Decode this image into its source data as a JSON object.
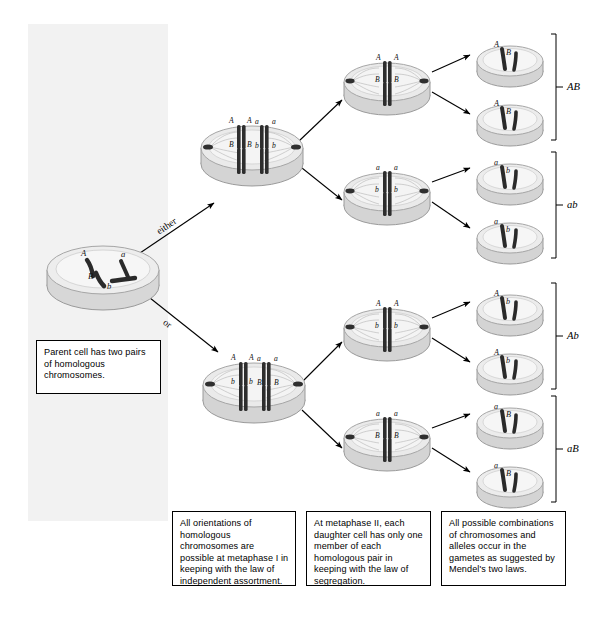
{
  "figure": {
    "background_color": "#ffffff",
    "panel_color": "#f2f2f2",
    "line_color": "#000000"
  },
  "branch_labels": {
    "upper": "either",
    "lower": "or"
  },
  "captions": [
    {
      "id": "parent-cell-caption",
      "text": "Parent cell has two pairs of homologous chromosomes."
    },
    {
      "id": "metaphase-one-caption",
      "text": "All orientations of homologous chromosomes are possible at metaphase I in keeping with the law of independent assortment."
    },
    {
      "id": "metaphase-two-caption",
      "text": "At metaphase II, each daughter cell has only one member of each homologous pair in keeping with the law of segregation."
    },
    {
      "id": "gametes-caption",
      "text": "All possible combinations of chromosomes and alleles occur in the gametes as suggested by Mendel's two laws."
    }
  ],
  "parent_cell": {
    "name": "parent-cell",
    "alleles": [
      "A",
      "a",
      "B",
      "b"
    ]
  },
  "metaphase_one_cells": [
    {
      "name": "metaphase-one-cell-upper",
      "top_row": [
        "A",
        "A",
        "a",
        "a"
      ],
      "bottom_row": [
        "B",
        "B",
        "b",
        "b"
      ]
    },
    {
      "name": "metaphase-one-cell-lower",
      "top_row": [
        "A",
        "A",
        "a",
        "a"
      ],
      "bottom_row": [
        "b",
        "b",
        "B",
        "B"
      ]
    }
  ],
  "metaphase_two_cells": [
    {
      "name": "metaphase-two-cell-1",
      "top_row": [
        "A",
        "A"
      ],
      "bottom_row": [
        "B",
        "B"
      ]
    },
    {
      "name": "metaphase-two-cell-2",
      "top_row": [
        "a",
        "a"
      ],
      "bottom_row": [
        "b",
        "b"
      ]
    },
    {
      "name": "metaphase-two-cell-3",
      "top_row": [
        "A",
        "A"
      ],
      "bottom_row": [
        "b",
        "b"
      ]
    },
    {
      "name": "metaphase-two-cell-4",
      "top_row": [
        "a",
        "a"
      ],
      "bottom_row": [
        "B",
        "B"
      ]
    }
  ],
  "gamete_groups": [
    {
      "name": "gamete-group-AB",
      "label": "AB",
      "cells": [
        {
          "alleles": [
            "A",
            "B"
          ]
        },
        {
          "alleles": [
            "A",
            "B"
          ]
        }
      ]
    },
    {
      "name": "gamete-group-ab",
      "label": "ab",
      "cells": [
        {
          "alleles": [
            "a",
            "b"
          ]
        },
        {
          "alleles": [
            "a",
            "b"
          ]
        }
      ]
    },
    {
      "name": "gamete-group-Ab",
      "label": "Ab",
      "cells": [
        {
          "alleles": [
            "A",
            "b"
          ]
        },
        {
          "alleles": [
            "A",
            "b"
          ]
        }
      ]
    },
    {
      "name": "gamete-group-aB",
      "label": "aB",
      "cells": [
        {
          "alleles": [
            "a",
            "B"
          ]
        },
        {
          "alleles": [
            "a",
            "B"
          ]
        }
      ]
    }
  ]
}
